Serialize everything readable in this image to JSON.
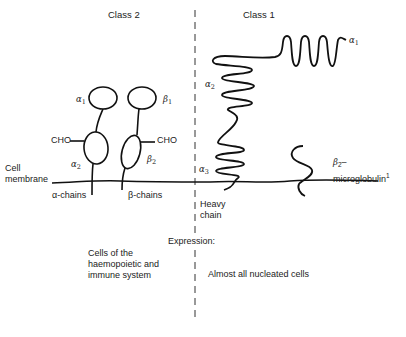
{
  "diagram": {
    "columns": {
      "left": {
        "title": "Class 2"
      },
      "right": {
        "title": "Class 1"
      }
    },
    "class2": {
      "domains": {
        "alpha1": {
          "symbol": "α",
          "sub": "1"
        },
        "beta1": {
          "symbol": "β",
          "sub": "1"
        },
        "alpha2": {
          "symbol": "α",
          "sub": "2"
        },
        "beta2": {
          "symbol": "β",
          "sub": "2"
        }
      },
      "carbohydrate_left": "CHO",
      "carbohydrate_right": "CHO",
      "alpha_chains_label": "α-chains",
      "beta_chains_label": "β-chains"
    },
    "class1": {
      "domains": {
        "alpha1": {
          "symbol": "α",
          "sub": "1"
        },
        "alpha2": {
          "symbol": "α",
          "sub": "2"
        },
        "alpha3": {
          "symbol": "α",
          "sub": "3"
        }
      },
      "heavy_chain_label_line1": "Heavy",
      "heavy_chain_label_line2": "chain",
      "b2m_symbol": "β",
      "b2m_sub": "2",
      "b2m_dash": "–",
      "b2m_word": "microglobulin",
      "b2m_footnote": "1"
    },
    "membrane_label_line1": "Cell",
    "membrane_label_line2": "membrane",
    "expression": {
      "heading": "Expression:",
      "class2_line1": "Cells of the",
      "class2_line2": "haemopoietic and",
      "class2_line3": "immune system",
      "class1": "Almost all nucleated cells"
    },
    "colors": {
      "line": "#111111",
      "text": "#222222",
      "background": "#ffffff"
    }
  }
}
